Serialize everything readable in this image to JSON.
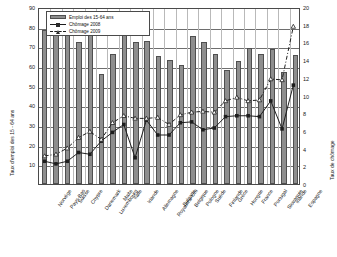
{
  "chart_data": {
    "type": "bar",
    "title": "",
    "subtitle": "",
    "xlabel": "",
    "ylabel": "Taux d'emploi des 15 - 64 ans",
    "ylabel_right": "Taux de chômage",
    "ylim": [
      0,
      90
    ],
    "ylim_right": [
      0,
      20
    ],
    "yticks": [
      0,
      10,
      20,
      30,
      40,
      50,
      60,
      70,
      80,
      90
    ],
    "yticks_right": [
      0,
      2,
      4,
      6,
      8,
      10,
      12,
      14,
      16,
      18,
      20
    ],
    "grid": true,
    "legend_position": "top-left",
    "categories": [
      "Norvège",
      "Pays-Bas",
      "Suisse",
      "Chypre",
      "Danemark",
      "Luxembourg",
      "Malte",
      "Italie",
      "Irlande",
      "Allemagne",
      "Royaume-Uni",
      "Bulgarie",
      "Belgique",
      "Pologne",
      "Suède",
      "Finlande",
      "Grèce",
      "Hongrie",
      "France",
      "Portugal",
      "Slovaquie",
      "Irlande",
      "Espagne"
    ],
    "series": [
      {
        "name": "Emploi des 15-64 ans",
        "type": "bar",
        "axis": "left",
        "color": "#8e8e8e",
        "values": [
          78.5,
          77.5,
          76.5,
          72.0,
          78.5,
          56.0,
          66.0,
          87.0,
          72.0,
          72.5,
          65.0,
          63.0,
          60.5,
          75.5,
          72.0,
          66.0,
          58.0,
          62.5,
          69.0,
          66.0,
          68.5,
          57.0,
          65.5
        ]
      },
      {
        "name": "Chômage 2008",
        "type": "line",
        "axis": "right",
        "color": "#1d1d1d",
        "marker": "square",
        "values": [
          2.6,
          2.3,
          2.6,
          3.6,
          3.4,
          4.9,
          5.9,
          6.8,
          3.0,
          7.3,
          5.6,
          5.6,
          7.0,
          7.1,
          6.2,
          6.4,
          7.7,
          7.8,
          7.8,
          7.7,
          9.5,
          6.3,
          11.3
        ]
      },
      {
        "name": "Chômage 2009",
        "type": "line",
        "axis": "right",
        "color": "#1d1d1d",
        "marker": "triangle",
        "values": [
          3.2,
          3.4,
          4.1,
          5.3,
          6.0,
          5.1,
          7.0,
          7.8,
          7.5,
          7.5,
          7.6,
          6.8,
          7.9,
          8.2,
          8.3,
          8.2,
          9.5,
          9.9,
          9.5,
          9.6,
          12.0,
          11.9,
          18.0
        ]
      }
    ]
  },
  "legend": {
    "items": [
      {
        "label": "Emploi des 15-64 ans",
        "key": "bar-key-icon"
      },
      {
        "label": "Chômage 2008",
        "key": "line-square-key-icon"
      },
      {
        "label": "Chômage 2009",
        "key": "line-triangle-key-icon"
      }
    ]
  }
}
